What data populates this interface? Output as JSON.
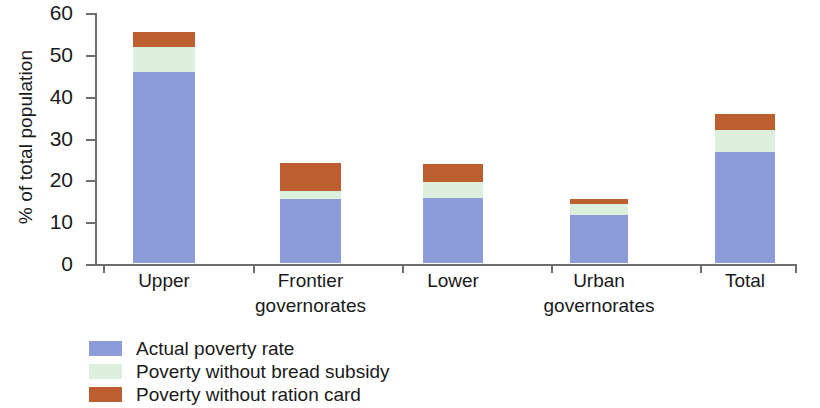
{
  "chart_data": {
    "type": "bar",
    "stacked": true,
    "title": "",
    "subtitle": "",
    "xlabel": "",
    "ylabel": "% of total population",
    "ylim": [
      0,
      60
    ],
    "ytick_labels": [
      "0",
      "10",
      "20",
      "30",
      "40",
      "50",
      "60"
    ],
    "ytick_values": [
      0,
      10,
      20,
      30,
      40,
      50,
      60
    ],
    "grid": false,
    "legend_position": "bottom-left",
    "categories": [
      "Upper",
      "Frontier governorates",
      "Lower",
      "Urban governorates",
      "Total"
    ],
    "category_lines": [
      [
        "Upper"
      ],
      [
        "Frontier",
        "governorates"
      ],
      [
        "Lower"
      ],
      [
        "Urban",
        "governorates"
      ],
      [
        "Total"
      ]
    ],
    "series": [
      {
        "name": "Actual poverty rate",
        "color": "#8c9cd8",
        "values": [
          45.7,
          15.3,
          15.6,
          11.5,
          26.6
        ]
      },
      {
        "name": "Poverty without bread subsidy",
        "color": "#dcefdc",
        "values": [
          6.0,
          1.9,
          3.8,
          2.6,
          5.2
        ]
      },
      {
        "name": "Poverty without ration card",
        "color": "#bd5e2e",
        "values": [
          3.6,
          6.7,
          4.3,
          1.2,
          3.8
        ]
      }
    ],
    "cumulative_tops": [
      [
        45.7,
        51.7,
        55.3
      ],
      [
        15.3,
        17.2,
        23.9
      ],
      [
        15.6,
        19.4,
        23.7
      ],
      [
        11.5,
        14.1,
        15.3
      ],
      [
        26.6,
        31.8,
        35.6
      ]
    ]
  },
  "colors": {
    "axis": "#6e6e6e",
    "text": "#1a1a1a",
    "background": "#ffffff",
    "series_blue": "#8c9cd8",
    "series_green": "#dcefdc",
    "series_orange": "#bd5e2e"
  }
}
